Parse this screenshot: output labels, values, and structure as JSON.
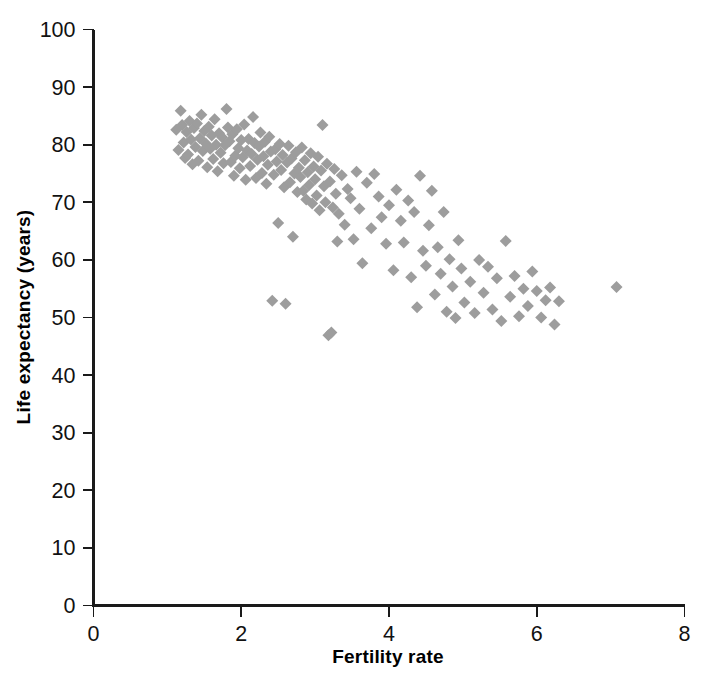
{
  "chart_data": {
    "type": "scatter",
    "title": "",
    "xlabel": "Fertility rate",
    "ylabel": "Life expectancy (years)",
    "xlim": [
      0,
      8
    ],
    "ylim": [
      0,
      100
    ],
    "xticks": [
      0,
      2,
      4,
      6,
      8
    ],
    "yticks": [
      0,
      10,
      20,
      30,
      40,
      50,
      60,
      70,
      80,
      90,
      100
    ],
    "xtick_labels": [
      "0",
      "2",
      "4",
      "6",
      "8"
    ],
    "ytick_labels": [
      "0",
      "10",
      "20",
      "30",
      "40",
      "50",
      "60",
      "70",
      "80",
      "90",
      "100"
    ],
    "grid": false,
    "legend": null,
    "marker": {
      "shape": "diamond",
      "color": "#9d9d9d",
      "size_px": 12
    },
    "series": [
      {
        "name": "Countries",
        "points": [
          [
            1.12,
            82.6
          ],
          [
            1.15,
            79.1
          ],
          [
            1.18,
            85.9
          ],
          [
            1.2,
            83.4
          ],
          [
            1.22,
            80.4
          ],
          [
            1.24,
            77.7
          ],
          [
            1.26,
            82.2
          ],
          [
            1.28,
            78.3
          ],
          [
            1.3,
            84.1
          ],
          [
            1.32,
            80.9
          ],
          [
            1.34,
            76.6
          ],
          [
            1.36,
            82.9
          ],
          [
            1.38,
            79.6
          ],
          [
            1.4,
            83.7
          ],
          [
            1.42,
            77.2
          ],
          [
            1.44,
            81.1
          ],
          [
            1.46,
            85.2
          ],
          [
            1.48,
            78.9
          ],
          [
            1.5,
            82.4
          ],
          [
            1.52,
            80.2
          ],
          [
            1.54,
            76.1
          ],
          [
            1.56,
            83.1
          ],
          [
            1.58,
            79.3
          ],
          [
            1.6,
            81.6
          ],
          [
            1.62,
            77.5
          ],
          [
            1.64,
            84.4
          ],
          [
            1.66,
            80.0
          ],
          [
            1.68,
            75.4
          ],
          [
            1.7,
            82.0
          ],
          [
            1.72,
            78.6
          ],
          [
            1.74,
            81.3
          ],
          [
            1.76,
            76.8
          ],
          [
            1.78,
            79.9
          ],
          [
            1.8,
            86.2
          ],
          [
            1.82,
            83.0
          ],
          [
            1.84,
            80.6
          ],
          [
            1.86,
            77.0
          ],
          [
            1.88,
            81.8
          ],
          [
            1.9,
            74.6
          ],
          [
            1.92,
            78.1
          ],
          [
            1.94,
            82.7
          ],
          [
            1.96,
            79.4
          ],
          [
            1.98,
            75.9
          ],
          [
            2.0,
            80.8
          ],
          [
            2.02,
            77.8
          ],
          [
            2.04,
            83.5
          ],
          [
            2.06,
            73.9
          ],
          [
            2.08,
            79.0
          ],
          [
            2.1,
            81.0
          ],
          [
            2.12,
            76.3
          ],
          [
            2.14,
            78.4
          ],
          [
            2.16,
            84.8
          ],
          [
            2.18,
            80.3
          ],
          [
            2.2,
            74.2
          ],
          [
            2.22,
            77.4
          ],
          [
            2.24,
            79.7
          ],
          [
            2.26,
            82.1
          ],
          [
            2.28,
            75.1
          ],
          [
            2.3,
            78.0
          ],
          [
            2.32,
            80.5
          ],
          [
            2.34,
            73.2
          ],
          [
            2.36,
            76.5
          ],
          [
            2.38,
            81.4
          ],
          [
            2.4,
            78.8
          ],
          [
            2.42,
            52.9
          ],
          [
            2.44,
            74.8
          ],
          [
            2.46,
            79.2
          ],
          [
            2.48,
            77.1
          ],
          [
            2.5,
            66.4
          ],
          [
            2.52,
            80.1
          ],
          [
            2.54,
            75.6
          ],
          [
            2.56,
            78.2
          ],
          [
            2.58,
            72.6
          ],
          [
            2.6,
            52.4
          ],
          [
            2.62,
            76.9
          ],
          [
            2.64,
            79.8
          ],
          [
            2.66,
            73.5
          ],
          [
            2.68,
            77.6
          ],
          [
            2.7,
            64.0
          ],
          [
            2.72,
            75.0
          ],
          [
            2.74,
            78.7
          ],
          [
            2.76,
            71.8
          ],
          [
            2.78,
            76.0
          ],
          [
            2.8,
            74.4
          ],
          [
            2.82,
            79.5
          ],
          [
            2.84,
            72.0
          ],
          [
            2.86,
            77.3
          ],
          [
            2.88,
            70.5
          ],
          [
            2.9,
            75.2
          ],
          [
            2.92,
            73.0
          ],
          [
            2.94,
            78.5
          ],
          [
            2.96,
            69.8
          ],
          [
            2.98,
            76.2
          ],
          [
            3.0,
            74.0
          ],
          [
            3.02,
            71.2
          ],
          [
            3.04,
            77.9
          ],
          [
            3.06,
            68.6
          ],
          [
            3.08,
            75.5
          ],
          [
            3.1,
            83.4
          ],
          [
            3.12,
            72.8
          ],
          [
            3.14,
            70.0
          ],
          [
            3.16,
            76.7
          ],
          [
            3.18,
            46.9
          ],
          [
            3.2,
            73.6
          ],
          [
            3.22,
            47.4
          ],
          [
            3.24,
            69.1
          ],
          [
            3.26,
            75.8
          ],
          [
            3.28,
            71.5
          ],
          [
            3.3,
            63.2
          ],
          [
            3.32,
            68.0
          ],
          [
            3.36,
            74.7
          ],
          [
            3.4,
            66.1
          ],
          [
            3.44,
            72.3
          ],
          [
            3.48,
            70.7
          ],
          [
            3.52,
            63.6
          ],
          [
            3.56,
            75.3
          ],
          [
            3.6,
            68.9
          ],
          [
            3.64,
            59.4
          ],
          [
            3.7,
            73.4
          ],
          [
            3.76,
            65.5
          ],
          [
            3.8,
            74.9
          ],
          [
            3.86,
            71.0
          ],
          [
            3.9,
            67.4
          ],
          [
            3.96,
            62.8
          ],
          [
            4.0,
            69.5
          ],
          [
            4.06,
            58.2
          ],
          [
            4.1,
            72.2
          ],
          [
            4.16,
            66.8
          ],
          [
            4.2,
            63.0
          ],
          [
            4.26,
            70.3
          ],
          [
            4.3,
            57.0
          ],
          [
            4.34,
            68.3
          ],
          [
            4.38,
            51.8
          ],
          [
            4.42,
            74.6
          ],
          [
            4.46,
            61.6
          ],
          [
            4.5,
            59.0
          ],
          [
            4.54,
            66.0
          ],
          [
            4.58,
            72.0
          ],
          [
            4.62,
            54.0
          ],
          [
            4.66,
            62.2
          ],
          [
            4.7,
            57.6
          ],
          [
            4.74,
            68.3
          ],
          [
            4.78,
            51.0
          ],
          [
            4.82,
            60.1
          ],
          [
            4.86,
            55.4
          ],
          [
            4.9,
            49.9
          ],
          [
            4.94,
            63.4
          ],
          [
            4.98,
            58.5
          ],
          [
            5.02,
            52.6
          ],
          [
            5.1,
            56.2
          ],
          [
            5.16,
            50.8
          ],
          [
            5.22,
            60.0
          ],
          [
            5.28,
            54.3
          ],
          [
            5.34,
            58.8
          ],
          [
            5.4,
            51.4
          ],
          [
            5.46,
            56.8
          ],
          [
            5.52,
            49.4
          ],
          [
            5.58,
            63.3
          ],
          [
            5.64,
            53.6
          ],
          [
            5.7,
            57.2
          ],
          [
            5.76,
            50.2
          ],
          [
            5.82,
            55.0
          ],
          [
            5.88,
            52.0
          ],
          [
            5.94,
            58.0
          ],
          [
            6.0,
            54.6
          ],
          [
            6.06,
            50.0
          ],
          [
            6.12,
            53.0
          ],
          [
            6.18,
            55.2
          ],
          [
            6.24,
            48.8
          ],
          [
            6.3,
            52.8
          ],
          [
            7.08,
            55.3
          ]
        ]
      }
    ]
  },
  "axes": {
    "x_title": "Fertility rate",
    "y_title": "Life expectancy (years)"
  }
}
